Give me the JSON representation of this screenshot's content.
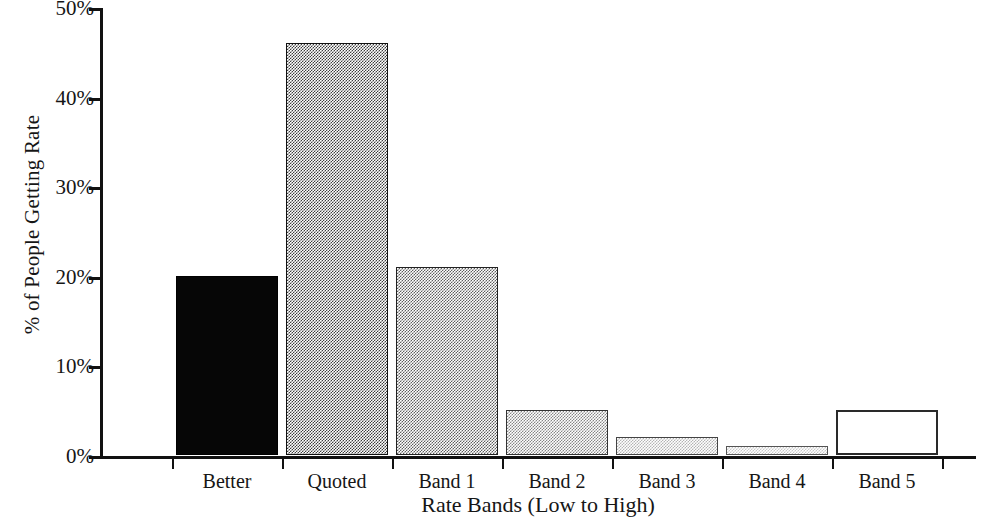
{
  "chart_data": {
    "type": "bar",
    "title": "",
    "xlabel": "Rate Bands (Low to High)",
    "ylabel": "% of People Getting Rate",
    "categories": [
      "Better",
      "Quoted",
      "Band 1",
      "Band 2",
      "Band 3",
      "Band 4",
      "Band 5"
    ],
    "values": [
      20,
      46,
      21,
      5,
      2,
      1,
      5
    ],
    "ylim": [
      0,
      50
    ],
    "ytick_values": [
      0,
      10,
      20,
      30,
      40,
      50
    ],
    "ytick_labels": [
      "0%",
      "10%",
      "20%",
      "30%",
      "40%",
      "50%"
    ],
    "grid": false,
    "legend": "none",
    "value_unit": "percent",
    "bar_fills": [
      "solid-black",
      "halftone-50",
      "halftone-38",
      "halftone-25",
      "halftone-12",
      "halftone-08",
      "open-white-outline"
    ]
  },
  "axes": {
    "y_title": "% of People Getting Rate",
    "x_title": "Rate Bands (Low to High)"
  }
}
